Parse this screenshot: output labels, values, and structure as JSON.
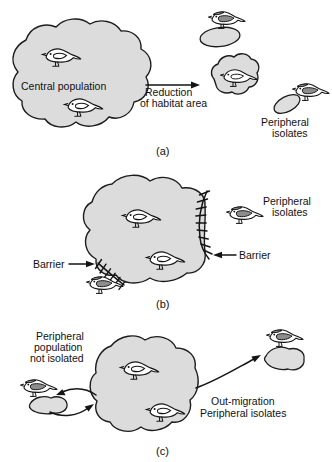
{
  "figure": {
    "title_cut_off": "",
    "panels": [
      {
        "id": "a",
        "caption": "(a)",
        "labels": {
          "central_population": "Central population",
          "process_line1": "Reduction",
          "process_line2": "of habitat area",
          "peripheral_line1": "Peripheral",
          "peripheral_line2": "isolates"
        },
        "bird_count_inside": 2,
        "bird_count_outside": 2,
        "isolate_count": 2
      },
      {
        "id": "b",
        "caption": "(b)",
        "labels": {
          "peripheral_line1": "Peripheral",
          "peripheral_line2": "isolates",
          "barrier_left": "Barrier",
          "barrier_right": "Barrier"
        },
        "bird_count_inside": 2,
        "bird_count_outside": 2,
        "barrier_count": 2
      },
      {
        "id": "c",
        "caption": "(c)",
        "labels": {
          "left_line1": "Peripheral",
          "left_line2": "population",
          "left_line3": "not isolated",
          "right_line1": "Out-migration",
          "right_line2": "Peripheral isolates"
        },
        "bird_count_inside": 2,
        "bird_count_outside": 2,
        "isolate_count": 2
      }
    ]
  },
  "colors": {
    "blob_fill": "#dcdcdc",
    "isolate_fill": "#dedede",
    "outline": "#1c1c1c",
    "bird_wing_shaded": "#8d8d8d",
    "background": "#ffffff",
    "text": "#111111"
  }
}
